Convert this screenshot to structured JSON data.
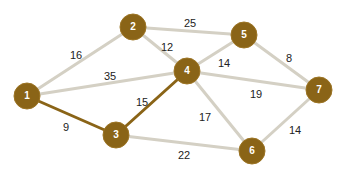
{
  "colors": {
    "node_fill": "#8a6417",
    "node_stroke": "#9c7424",
    "edge_default": "#d4d0c4",
    "edge_highlight": "#8a6417",
    "background": "#ffffff"
  },
  "nodes": [
    {
      "id": "1",
      "label": "1",
      "x": 27,
      "y": 96
    },
    {
      "id": "2",
      "label": "2",
      "x": 133,
      "y": 27
    },
    {
      "id": "3",
      "label": "3",
      "x": 116,
      "y": 135
    },
    {
      "id": "4",
      "label": "4",
      "x": 187,
      "y": 71
    },
    {
      "id": "5",
      "label": "5",
      "x": 244,
      "y": 35
    },
    {
      "id": "6",
      "label": "6",
      "x": 252,
      "y": 151
    },
    {
      "id": "7",
      "label": "7",
      "x": 319,
      "y": 90
    }
  ],
  "edges": [
    {
      "from": "1",
      "to": "2",
      "weight": "16",
      "highlight": false,
      "lx": 76,
      "ly": 56
    },
    {
      "from": "1",
      "to": "4",
      "weight": "35",
      "highlight": false,
      "lx": 110,
      "ly": 77
    },
    {
      "from": "1",
      "to": "3",
      "weight": "9",
      "highlight": true,
      "lx": 66,
      "ly": 128
    },
    {
      "from": "2",
      "to": "5",
      "weight": "25",
      "highlight": false,
      "lx": 190,
      "ly": 24
    },
    {
      "from": "2",
      "to": "4",
      "weight": "12",
      "highlight": false,
      "lx": 167,
      "ly": 48
    },
    {
      "from": "3",
      "to": "4",
      "weight": "15",
      "highlight": true,
      "lx": 142,
      "ly": 103
    },
    {
      "from": "3",
      "to": "6",
      "weight": "22",
      "highlight": false,
      "lx": 184,
      "ly": 156
    },
    {
      "from": "4",
      "to": "5",
      "weight": "14",
      "highlight": false,
      "lx": 224,
      "ly": 64
    },
    {
      "from": "4",
      "to": "7",
      "weight": "19",
      "highlight": false,
      "lx": 256,
      "ly": 95
    },
    {
      "from": "4",
      "to": "6",
      "weight": "17",
      "highlight": false,
      "lx": 205,
      "ly": 118
    },
    {
      "from": "5",
      "to": "7",
      "weight": "8",
      "highlight": false,
      "lx": 289,
      "ly": 59
    },
    {
      "from": "6",
      "to": "7",
      "weight": "14",
      "highlight": false,
      "lx": 295,
      "ly": 131
    }
  ]
}
